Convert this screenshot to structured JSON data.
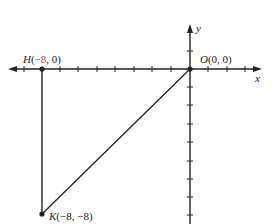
{
  "diagram": {
    "type": "coordinate-plane-triangle",
    "axes": {
      "x_label": "x",
      "y_label": "y",
      "unit_px": 18.5,
      "origin_px": [
        190,
        69
      ]
    },
    "points": [
      {
        "id": "H",
        "name": "H",
        "coords": "(",
        "x": "−8",
        "rest": ", 0)",
        "x_val": -8,
        "y_val": 0,
        "label_color_x": "#d03030"
      },
      {
        "id": "O",
        "name": "O",
        "coords": "(0, 0)",
        "x_val": 0,
        "y_val": 0
      },
      {
        "id": "K",
        "name": "K",
        "coords": "(−8, −8)",
        "x_val": -8,
        "y_val": -8
      }
    ],
    "segments": [
      {
        "from": "H",
        "to": "O"
      },
      {
        "from": "H",
        "to": "K"
      },
      {
        "from": "K",
        "to": "O"
      }
    ],
    "colors": {
      "ink": "#222222",
      "accent": "#d03030"
    }
  },
  "labels": {
    "H_name": "H",
    "H_open": "(",
    "H_x": "−8",
    "H_rest": ", 0)",
    "O_name": "O",
    "O_coords": "(0, 0)",
    "K_name": "K",
    "K_coords": "(−8, −8)",
    "x_axis": "x",
    "y_axis": "y"
  }
}
